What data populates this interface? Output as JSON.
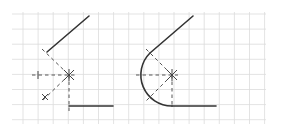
{
  "diagram": {
    "figures": [
      {
        "name": "construction",
        "description": "Two lines with dashed construction lines to the arc center"
      },
      {
        "name": "result",
        "description": "Two lines joined by a tangent arc (fillet)"
      }
    ],
    "colors": {
      "grid": "#dcdcdc",
      "line": "#333333",
      "construction": "#555555"
    }
  }
}
